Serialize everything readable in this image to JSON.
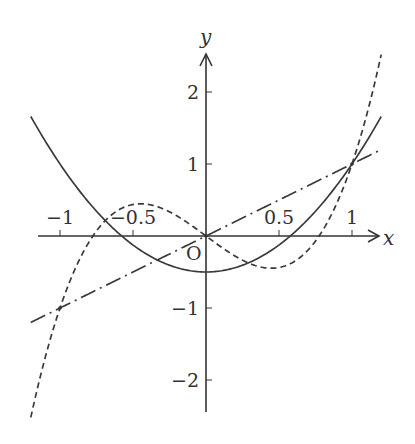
{
  "chart_data": {
    "type": "line",
    "title": "",
    "xlabel": "x",
    "ylabel": "y",
    "origin_label": "O",
    "xlim": [
      -1.2,
      1.2
    ],
    "ylim": [
      -2.5,
      2.5
    ],
    "grid": false,
    "legend": "none",
    "x_ticks": [
      {
        "value": -1,
        "label": "−1"
      },
      {
        "value": -0.5,
        "label": "−0.5"
      },
      {
        "value": 0.5,
        "label": "0.5"
      },
      {
        "value": 1,
        "label": "1"
      }
    ],
    "y_ticks": [
      {
        "value": 2,
        "label": "2"
      },
      {
        "value": 1,
        "label": "1"
      },
      {
        "value": -1,
        "label": "−1"
      },
      {
        "value": -2,
        "label": "−2"
      }
    ],
    "series": [
      {
        "name": "y = x",
        "style": "dash-dot",
        "coeffs": [
          0,
          1,
          0,
          0
        ],
        "domain": [
          -1.2,
          1.2
        ]
      },
      {
        "name": "y = (3x^2 - 1)/2",
        "style": "solid",
        "coeffs": [
          -0.5,
          0,
          1.5,
          0
        ],
        "domain": [
          -1.2,
          1.2
        ]
      },
      {
        "name": "y = (5x^3 - 3x)/2",
        "style": "dashed",
        "coeffs": [
          0,
          -1.5,
          0,
          2.5
        ],
        "domain": [
          -1.2,
          1.2
        ]
      }
    ],
    "intersections": [
      {
        "x": 1,
        "y": 1
      },
      {
        "x": -1,
        "y": -1
      },
      {
        "x": 0,
        "y": 0
      }
    ]
  }
}
